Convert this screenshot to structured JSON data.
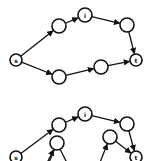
{
  "diagrams": [
    {
      "name": "graph-top",
      "nodes": [
        {
          "id": "s",
          "label": "s",
          "x": 16,
          "y": 60,
          "r": 6
        },
        {
          "id": "a",
          "label": "",
          "x": 59,
          "y": 26,
          "r": 7
        },
        {
          "id": "i",
          "label": "i",
          "x": 85,
          "y": 15,
          "r": 7
        },
        {
          "id": "b",
          "label": "",
          "x": 127,
          "y": 25,
          "r": 7
        },
        {
          "id": "t",
          "label": "t",
          "x": 136,
          "y": 60,
          "r": 6
        },
        {
          "id": "c",
          "label": "",
          "x": 59,
          "y": 77,
          "r": 7
        },
        {
          "id": "d",
          "label": "",
          "x": 101,
          "y": 67,
          "r": 7
        }
      ],
      "edges": [
        {
          "from": "s",
          "to": "a"
        },
        {
          "from": "a",
          "to": "i"
        },
        {
          "from": "i",
          "to": "b"
        },
        {
          "from": "b",
          "to": "t"
        },
        {
          "from": "s",
          "to": "c"
        },
        {
          "from": "c",
          "to": "d"
        },
        {
          "from": "d",
          "to": "t"
        }
      ]
    },
    {
      "name": "graph-bottom",
      "nodes": [
        {
          "id": "s",
          "label": "s",
          "x": 16,
          "y": 157,
          "r": 6
        },
        {
          "id": "a",
          "label": "",
          "x": 59,
          "y": 125,
          "r": 7
        },
        {
          "id": "i",
          "label": "i",
          "x": 85,
          "y": 114,
          "r": 7
        },
        {
          "id": "b",
          "label": "",
          "x": 127,
          "y": 124,
          "r": 7
        },
        {
          "id": "t",
          "label": "t",
          "x": 136,
          "y": 157,
          "r": 6
        },
        {
          "id": "c",
          "label": "",
          "x": 57,
          "y": 143,
          "r": 7
        },
        {
          "id": "d",
          "label": "",
          "x": 110,
          "y": 137,
          "r": 7
        }
      ],
      "edges": [
        {
          "from": "s",
          "to": "a"
        },
        {
          "from": "a",
          "to": "i"
        },
        {
          "from": "i",
          "to": "b"
        },
        {
          "from": "b",
          "to": "t"
        },
        {
          "from": "d",
          "to": "t"
        },
        {
          "from_point": [
            46,
            165
          ],
          "to": "c"
        },
        {
          "from_point": [
            99,
            165
          ],
          "to": "d"
        }
      ],
      "open_edges_from_c": [
        [
          48,
          165
        ],
        [
          68,
          165
        ]
      ]
    }
  ]
}
